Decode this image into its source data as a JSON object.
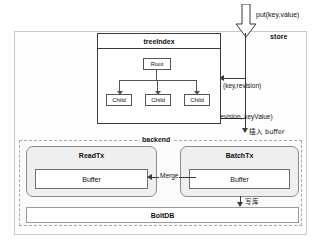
{
  "diagram": {
    "store": {
      "label": "store"
    },
    "put_arrow": {
      "icon": "down-arrow-icon",
      "label": "put(key,value)"
    },
    "treeindex": {
      "title": "treeIndex",
      "root": "Root",
      "children": [
        "Child",
        "Child",
        "Child"
      ]
    },
    "edges": {
      "key_revision": "(key,revision)",
      "revision_keyvalue": "(revision,  keyValue)",
      "insert_buffer": "插入 buffer",
      "merge": "Merge",
      "write_db": "写库"
    },
    "backend": {
      "label": "backend",
      "readtx": {
        "title": "ReadTx",
        "buffer": "Buffer"
      },
      "batchtx": {
        "title": "BatchTx",
        "buffer": "Buffer"
      },
      "boltdb": "BoltDB"
    },
    "colors": {
      "box_border": "#3a3a3a",
      "dashed_border": "#a9a9a9",
      "tx_fill": "#efefef",
      "arrow": "#3a3a3a"
    }
  }
}
